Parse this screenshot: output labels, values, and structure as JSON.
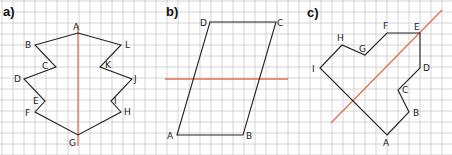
{
  "grid": {
    "cell_size_px": 11,
    "line_color": "#c9c9c9",
    "offset_x": 2,
    "offset_y": 1
  },
  "colors": {
    "shape_stroke": "#222222",
    "axis_stroke": "#e0704f",
    "background": "#ffffff"
  },
  "panels": [
    {
      "id": "a",
      "label": "a)",
      "label_pos": [
        3,
        16
      ],
      "shape_type": "closed-polygon",
      "vertices": [
        {
          "name": "A",
          "x": 78,
          "y": 33,
          "lx": 73,
          "ly": 30
        },
        {
          "name": "L",
          "x": 121,
          "y": 45,
          "lx": 125,
          "ly": 48
        },
        {
          "name": "K",
          "x": 100,
          "y": 67,
          "lx": 105,
          "ly": 68
        },
        {
          "name": "J",
          "x": 132,
          "y": 79,
          "lx": 134,
          "ly": 82
        },
        {
          "name": "I",
          "x": 111,
          "y": 101,
          "lx": 114,
          "ly": 104
        },
        {
          "name": "H",
          "x": 121,
          "y": 112,
          "lx": 124,
          "ly": 115
        },
        {
          "name": "G",
          "x": 78,
          "y": 135,
          "lx": 69,
          "ly": 146
        },
        {
          "name": "F",
          "x": 35,
          "y": 112,
          "lx": 25,
          "ly": 116
        },
        {
          "name": "E",
          "x": 45,
          "y": 101,
          "lx": 33,
          "ly": 104
        },
        {
          "name": "D",
          "x": 24,
          "y": 79,
          "lx": 14,
          "ly": 82
        },
        {
          "name": "C",
          "x": 56,
          "y": 67,
          "lx": 42,
          "ly": 69
        },
        {
          "name": "B",
          "x": 35,
          "y": 45,
          "lx": 25,
          "ly": 48
        }
      ],
      "axis": {
        "x1": 78,
        "y1": 25,
        "x2": 78,
        "y2": 146
      }
    },
    {
      "id": "b",
      "label": "b)",
      "label_pos": [
        166,
        16
      ],
      "shape_type": "parallelogram",
      "vertices": [
        {
          "name": "A",
          "x": 177,
          "y": 135,
          "lx": 167,
          "ly": 139
        },
        {
          "name": "B",
          "x": 243,
          "y": 135,
          "lx": 246,
          "ly": 139
        },
        {
          "name": "C",
          "x": 276,
          "y": 22,
          "lx": 277,
          "ly": 26
        },
        {
          "name": "D",
          "x": 210,
          "y": 22,
          "lx": 200,
          "ly": 26
        }
      ],
      "axis": {
        "x1": 165,
        "y1": 79,
        "x2": 288,
        "y2": 79
      }
    },
    {
      "id": "c",
      "label": "c)",
      "label_pos": [
        307,
        17
      ],
      "shape_type": "closed-polygon",
      "vertices": [
        {
          "name": "A",
          "x": 387,
          "y": 135,
          "lx": 383,
          "ly": 146
        },
        {
          "name": "B",
          "x": 409,
          "y": 112,
          "lx": 413,
          "ly": 116
        },
        {
          "name": "C",
          "x": 398,
          "y": 90,
          "lx": 402,
          "ly": 93
        },
        {
          "name": "D",
          "x": 420,
          "y": 68,
          "lx": 423,
          "ly": 71
        },
        {
          "name": "E",
          "x": 420,
          "y": 33,
          "lx": 414,
          "ly": 30
        },
        {
          "name": "F",
          "x": 387,
          "y": 33,
          "lx": 383,
          "ly": 29
        },
        {
          "name": "G",
          "x": 365,
          "y": 55,
          "lx": 359,
          "ly": 52
        },
        {
          "name": "H",
          "x": 342,
          "y": 45,
          "lx": 337,
          "ly": 41
        },
        {
          "name": "I",
          "x": 320,
          "y": 68,
          "lx": 312,
          "ly": 72
        }
      ],
      "axis": {
        "x1": 331,
        "y1": 123,
        "x2": 442,
        "y2": 10
      }
    }
  ]
}
